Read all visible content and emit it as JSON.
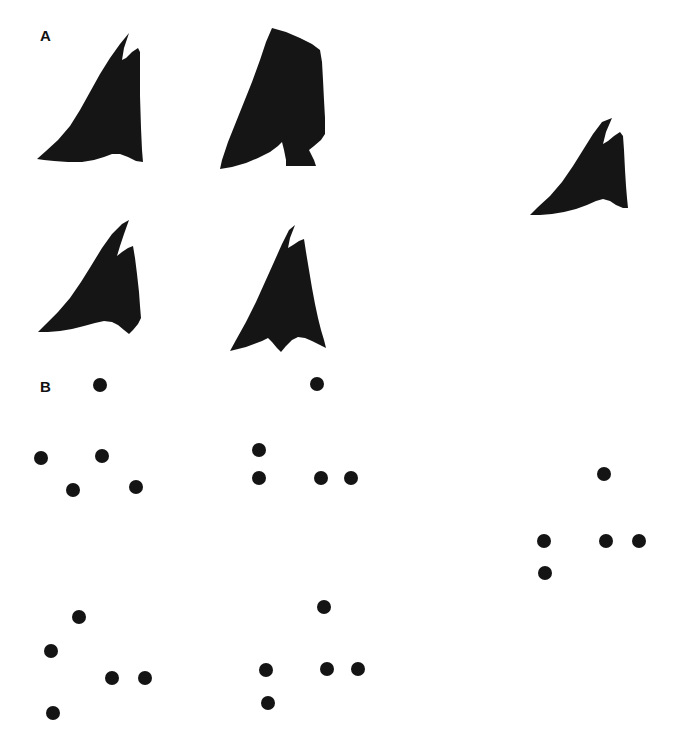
{
  "figure": {
    "width": 681,
    "height": 748,
    "background_color": "#ffffff",
    "ink_color": "#151515"
  },
  "panels": [
    {
      "id": "A",
      "label": "A",
      "label_position": {
        "x": 40,
        "y": 28
      },
      "description": "Five solid black arrowhead-like silhouettes"
    },
    {
      "id": "B",
      "label": "B",
      "label_position": {
        "x": 40,
        "y": 379
      },
      "description": "Five dot configurations corresponding to panel A shapes"
    }
  ],
  "chart_data": {
    "type": "scatter",
    "title": "",
    "xlabel": "",
    "ylabel": "",
    "grid": false,
    "legend": false,
    "xlim": [
      0,
      681
    ],
    "ylim": [
      748,
      0
    ],
    "panel_a_shapes": [
      {
        "name": "shape-top-left",
        "points": "80,34 86,36 88,44 88,58 98,44 104,34 108,30 110,34 108,44 106,52 110,56 118,50 126,42 130,36 130,44 126,54 122,62 124,66 130,62 134,56 134,62 130,72 126,80 128,84 130,80 132,76 132,82 128,90 126,96 128,98 130,94 130,100 126,108 124,114 126,116 128,112 128,118 124,126 122,132 124,134 126,130 126,136 122,144 120,150 124,152 128,148 132,144 136,146 138,152 140,158 142,162 140,166 134,164 128,160 122,156 116,154 110,156 104,160 96,162 86,162 74,160 62,158 52,157 44,157 38,158 42,152 52,144 62,134 70,124 76,112 80,100 82,86 82,70 82,54 80,42",
        "simplified_path": "M 130,33 L 122,62 L 140,53 L 140,165 L 38,160 L 130,33 Z"
      },
      {
        "name": "shape-top-middle",
        "simplified_path": ""
      },
      {
        "name": "shape-top-right",
        "simplified_path": ""
      },
      {
        "name": "shape-bottom-left",
        "simplified_path": ""
      },
      {
        "name": "shape-bottom-middle",
        "simplified_path": ""
      }
    ],
    "panel_b_dot_groups": [
      {
        "name": "dots-top-left",
        "dots": [
          {
            "x": 100,
            "y": 385
          },
          {
            "x": 41,
            "y": 458
          },
          {
            "x": 102,
            "y": 456
          },
          {
            "x": 73,
            "y": 490
          },
          {
            "x": 136,
            "y": 487
          }
        ]
      },
      {
        "name": "dots-top-middle",
        "dots": [
          {
            "x": 317,
            "y": 384
          },
          {
            "x": 259,
            "y": 450
          },
          {
            "x": 259,
            "y": 478
          },
          {
            "x": 321,
            "y": 478
          },
          {
            "x": 351,
            "y": 478
          }
        ]
      },
      {
        "name": "dots-right",
        "dots": [
          {
            "x": 604,
            "y": 474
          },
          {
            "x": 544,
            "y": 541
          },
          {
            "x": 606,
            "y": 541
          },
          {
            "x": 639,
            "y": 541
          },
          {
            "x": 545,
            "y": 573
          }
        ]
      },
      {
        "name": "dots-bottom-left",
        "dots": [
          {
            "x": 79,
            "y": 617
          },
          {
            "x": 51,
            "y": 651
          },
          {
            "x": 112,
            "y": 678
          },
          {
            "x": 145,
            "y": 678
          },
          {
            "x": 53,
            "y": 713
          }
        ]
      },
      {
        "name": "dots-bottom-middle",
        "dots": [
          {
            "x": 324,
            "y": 607
          },
          {
            "x": 266,
            "y": 670
          },
          {
            "x": 327,
            "y": 669
          },
          {
            "x": 358,
            "y": 669
          },
          {
            "x": 268,
            "y": 703
          }
        ]
      }
    ],
    "dot_radius": 7
  }
}
